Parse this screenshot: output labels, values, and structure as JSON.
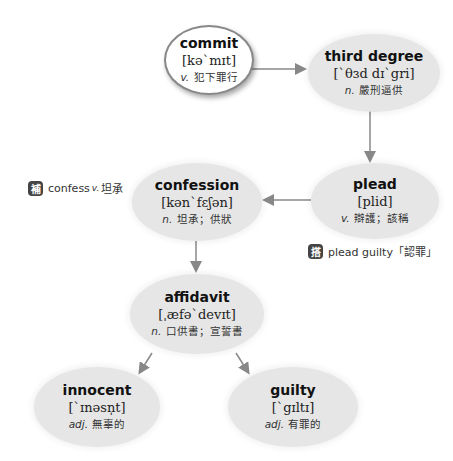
{
  "nodes": {
    "commit": {
      "word": "commit",
      "ipa": "[kə`mɪt]",
      "pos": "v.",
      "meaning": "犯下罪行"
    },
    "third_degree": {
      "word": "third degree",
      "ipa": "[`θɜd dɪ`gri]",
      "pos": "n.",
      "meaning": "嚴刑逼供"
    },
    "plead": {
      "word": "plead",
      "ipa": "[plid]",
      "pos": "v.",
      "meaning": "辯護；該稱"
    },
    "confession": {
      "word": "confession",
      "ipa": "[kən`fɛʃən]",
      "pos": "n.",
      "meaning": "坦承；供狀"
    },
    "affidavit": {
      "word": "affidavit",
      "ipa": "[ˌæfə`devɪt]",
      "pos": "n.",
      "meaning": "口供書；宣誓書"
    },
    "innocent": {
      "word": "innocent",
      "ipa": "[`ɪnəsn̩t]",
      "pos": "adj.",
      "meaning": "無辜的"
    },
    "guilty": {
      "word": "guilty",
      "ipa": "[`gɪltɪ]",
      "pos": "adj.",
      "meaning": "有罪的"
    }
  },
  "notes": {
    "supplement": {
      "badge": "補",
      "word": "confess",
      "pos": "v.",
      "meaning": "坦承"
    },
    "collocation": {
      "badge": "搭",
      "text": "plead guilty「認罪」"
    }
  },
  "colors": {
    "node_fill": "#e6e6e6",
    "arrow": "#888888",
    "badge": "#444444"
  }
}
